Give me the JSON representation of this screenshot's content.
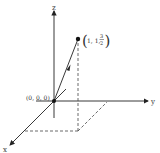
{
  "diagram": {
    "axes": {
      "x_label": "x",
      "y_label": "y",
      "z_label": "z"
    },
    "origin_label": "(0, 0, 0)",
    "point": {
      "label_prefix": "1, 1, ",
      "label_num": "3",
      "label_den": "2",
      "coords": [
        1,
        1,
        1.5
      ]
    },
    "colors": {
      "axis": "#222222",
      "dashed": "#444444",
      "text": "#333333"
    }
  }
}
